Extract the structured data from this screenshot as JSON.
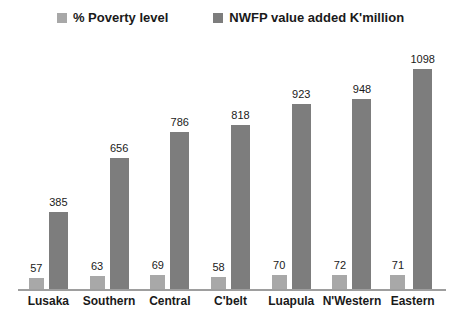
{
  "chart_data": {
    "type": "bar",
    "title": "",
    "categories": [
      "Lusaka",
      "Southern",
      "Central",
      "C'belt",
      "Luapula",
      "N'Western",
      "Eastern"
    ],
    "series": [
      {
        "name": "% Poverty level",
        "color": "#a8a8a8",
        "values": [
          57,
          63,
          69,
          58,
          70,
          72,
          71
        ]
      },
      {
        "name": "NWFP value added K'million",
        "color": "#7d7d7d",
        "values": [
          385,
          656,
          786,
          818,
          923,
          948,
          1098
        ]
      }
    ],
    "xlabel": "",
    "ylabel": "",
    "ylim": [
      0,
      1100
    ],
    "grid": false,
    "legend_position": "top",
    "value_labels": true
  },
  "colors": {
    "background": "#ffffff",
    "axis_line": "#9e9e9e",
    "text": "#1a1a1a"
  }
}
